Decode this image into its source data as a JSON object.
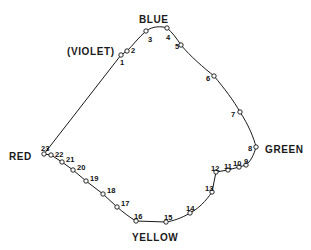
{
  "figure": {
    "background_color": "#ffffff",
    "line_color": "#1a1a1a",
    "marker_fill": "#ffffff",
    "marker_stroke": "#111111"
  },
  "region_labels": [
    {
      "id": "blue",
      "text": "BLUE",
      "x": 139,
      "y": 15
    },
    {
      "id": "violet",
      "text": "(VIOLET)",
      "x": 67,
      "y": 47
    },
    {
      "id": "green",
      "text": "GREEN",
      "x": 265,
      "y": 145
    },
    {
      "id": "red",
      "text": "RED",
      "x": 9,
      "y": 152
    },
    {
      "id": "yellow",
      "text": "YELLOW",
      "x": 132,
      "y": 233
    }
  ],
  "chart_data": {
    "type": "scatter",
    "xlabel": "",
    "ylabel": "",
    "grid": false,
    "legend": "none",
    "xlim": [
      0,
      311
    ],
    "ylim": [
      250,
      0
    ],
    "annotations": [
      "BLUE",
      "(VIOLET)",
      "GREEN",
      "RED",
      "YELLOW"
    ],
    "series": [
      {
        "name": "numbered sample points",
        "points": [
          {
            "label": "1",
            "x": 121,
            "y": 55,
            "lx": 120,
            "ly": 59
          },
          {
            "label": "2",
            "x": 127,
            "y": 51,
            "lx": 131,
            "ly": 47
          },
          {
            "label": "3",
            "x": 146,
            "y": 31,
            "lx": 148,
            "ly": 36
          },
          {
            "label": "4",
            "x": 167,
            "y": 28,
            "lx": 166,
            "ly": 34
          },
          {
            "label": "5",
            "x": 181,
            "y": 45,
            "lx": 175,
            "ly": 43
          },
          {
            "label": "6",
            "x": 214,
            "y": 76,
            "lx": 206,
            "ly": 75
          },
          {
            "label": "7",
            "x": 240,
            "y": 112,
            "lx": 231,
            "ly": 111
          },
          {
            "label": "8",
            "x": 256,
            "y": 147,
            "lx": 248,
            "ly": 145
          },
          {
            "label": "9",
            "x": 246,
            "y": 165,
            "lx": 244,
            "ly": 158
          },
          {
            "label": "10",
            "x": 239,
            "y": 167,
            "lx": 233,
            "ly": 160
          },
          {
            "label": "11",
            "x": 228,
            "y": 170,
            "lx": 224,
            "ly": 163
          },
          {
            "label": "12",
            "x": 216,
            "y": 172,
            "lx": 211,
            "ly": 165
          },
          {
            "label": "13",
            "x": 212,
            "y": 192,
            "lx": 205,
            "ly": 185
          },
          {
            "label": "14",
            "x": 190,
            "y": 213,
            "lx": 186,
            "ly": 205
          },
          {
            "label": "15",
            "x": 166,
            "y": 222,
            "lx": 164,
            "ly": 214
          },
          {
            "label": "16",
            "x": 136,
            "y": 221,
            "lx": 134,
            "ly": 213
          },
          {
            "label": "17",
            "x": 117,
            "y": 207,
            "lx": 121,
            "ly": 200
          },
          {
            "label": "18",
            "x": 103,
            "y": 194,
            "lx": 107,
            "ly": 187
          },
          {
            "label": "19",
            "x": 86,
            "y": 181,
            "lx": 90,
            "ly": 175
          },
          {
            "label": "20",
            "x": 73,
            "y": 170,
            "lx": 77,
            "ly": 164
          },
          {
            "label": "21",
            "x": 62,
            "y": 162,
            "lx": 66,
            "ly": 156
          },
          {
            "label": "22",
            "x": 51,
            "y": 155,
            "lx": 55,
            "ly": 151
          },
          {
            "label": "23",
            "x": 44,
            "y": 154,
            "lx": 41,
            "ly": 145
          }
        ]
      }
    ],
    "spectral_locus_path": "M 121 55 L 127 51 C 133 45 139 37 146 31 C 153 26 161 26 167 28 C 172 32 177 39 181 45 C 190 56 204 68 214 76 C 224 88 234 101 240 112 C 248 124 254 138 256 147 C 254 155 250 162 246 165 L 239 167 L 228 170 L 216 172 L 212 192 C 206 201 198 209 190 213 C 182 218 173 221 166 222 L 136 221 C 129 217 123 212 117 207 L 103 194 L 86 181 L 73 170 L 62 162 L 51 155 L 44 154",
    "purple_line_path": "M 44 154 L 121 55"
  }
}
